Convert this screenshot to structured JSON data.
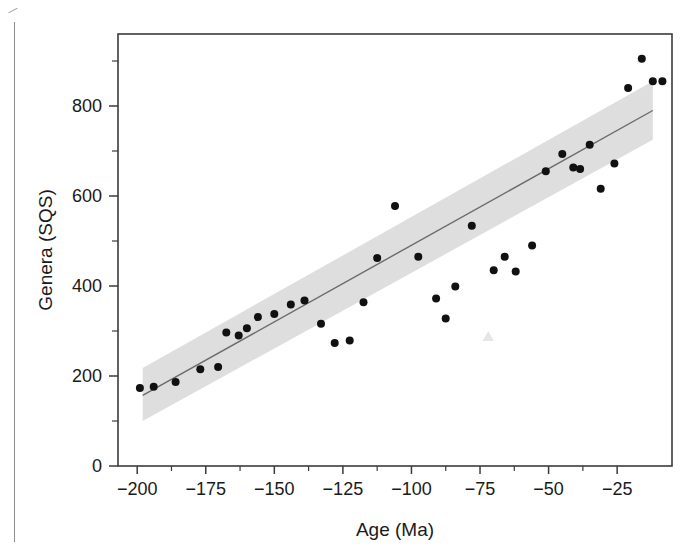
{
  "chart_data": {
    "type": "scatter",
    "title": "",
    "xlabel": "Age (Ma)",
    "ylabel": "Genera (SQS)",
    "xlim": [
      -207,
      -5
    ],
    "ylim": [
      0,
      960
    ],
    "xticks": [
      -200,
      -175,
      -150,
      -125,
      -100,
      -75,
      -50,
      -25
    ],
    "xtick_labels": [
      "−200",
      "−175",
      "−150",
      "−125",
      "−100",
      "−75",
      "−50",
      "−25"
    ],
    "xminor_step": 12.5,
    "yticks": [
      0,
      200,
      400,
      600,
      800
    ],
    "ytick_labels": [
      "0",
      "200",
      "400",
      "600",
      "800"
    ],
    "yminor_step": 100,
    "grid": false,
    "legend": null,
    "marker": {
      "shape": "circle",
      "color": "#111111",
      "size": 5.6
    },
    "points": [
      {
        "x": -199.0,
        "y": 173
      },
      {
        "x": -194.0,
        "y": 176
      },
      {
        "x": -186.0,
        "y": 187
      },
      {
        "x": -177.0,
        "y": 215
      },
      {
        "x": -170.5,
        "y": 220
      },
      {
        "x": -167.5,
        "y": 297
      },
      {
        "x": -163.0,
        "y": 290
      },
      {
        "x": -160.0,
        "y": 306
      },
      {
        "x": -156.0,
        "y": 331
      },
      {
        "x": -150.0,
        "y": 338
      },
      {
        "x": -144.0,
        "y": 359
      },
      {
        "x": -139.0,
        "y": 368
      },
      {
        "x": -133.0,
        "y": 316
      },
      {
        "x": -128.0,
        "y": 273
      },
      {
        "x": -122.5,
        "y": 279
      },
      {
        "x": -117.5,
        "y": 364
      },
      {
        "x": -112.5,
        "y": 462
      },
      {
        "x": -106.0,
        "y": 578
      },
      {
        "x": -97.5,
        "y": 465
      },
      {
        "x": -91.0,
        "y": 372
      },
      {
        "x": -87.5,
        "y": 328
      },
      {
        "x": -84.0,
        "y": 399
      },
      {
        "x": -78.0,
        "y": 534
      },
      {
        "x": -70.0,
        "y": 435
      },
      {
        "x": -66.0,
        "y": 465
      },
      {
        "x": -62.0,
        "y": 432
      },
      {
        "x": -56.0,
        "y": 490
      },
      {
        "x": -51.0,
        "y": 655
      },
      {
        "x": -45.0,
        "y": 693
      },
      {
        "x": -41.0,
        "y": 663
      },
      {
        "x": -38.5,
        "y": 660
      },
      {
        "x": -35.0,
        "y": 714
      },
      {
        "x": -31.0,
        "y": 616
      },
      {
        "x": -26.0,
        "y": 672
      },
      {
        "x": -21.0,
        "y": 840
      },
      {
        "x": -16.0,
        "y": 905
      },
      {
        "x": -12.0,
        "y": 855
      },
      {
        "x": -8.5,
        "y": 855
      }
    ],
    "trend_line": {
      "name": "regression-line",
      "color": "#6b6b6b",
      "x_start": -198.0,
      "y_start": 157,
      "x_end": -12.0,
      "y_end": 790
    },
    "confidence_band": {
      "name": "confidence-band",
      "color": "#dcdcdc",
      "x_start": -198.0,
      "x_end": -12.0,
      "lower_start": 100,
      "upper_start": 218,
      "lower_end": 725,
      "upper_end": 855
    },
    "artifact_marker": {
      "name": "faint-triangle-artifact",
      "x": -72.0,
      "y": 288,
      "color": "#e6e6e6"
    }
  },
  "axes": {
    "x_label": "Age (Ma)",
    "y_label": "Genera (SQS)"
  }
}
